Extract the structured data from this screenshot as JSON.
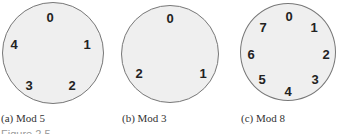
{
  "panels": [
    {
      "caption": "(a) Mod 5",
      "labels": [
        "0",
        "1",
        "2",
        "3",
        "4"
      ]
    },
    {
      "caption": "(b) Mod 3",
      "labels": [
        "0",
        "1",
        "2"
      ]
    },
    {
      "caption": "(c) Mod 8",
      "labels": [
        "0",
        "1",
        "2",
        "3",
        "4",
        "5",
        "6",
        "7"
      ]
    }
  ],
  "figure_label": "Figure 2.5"
}
